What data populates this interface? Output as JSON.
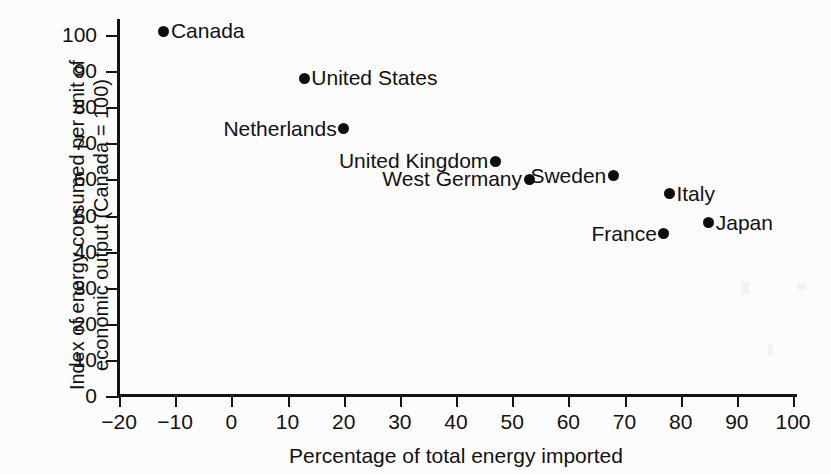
{
  "figure": {
    "top_caption_partial": "",
    "background_color": "#fcfcfc",
    "ink_color": "#111111"
  },
  "chart_data": {
    "type": "scatter",
    "title": "",
    "xlabel": "Percentage of total energy imported",
    "ylabel": "Index of energy consumed per unit of economic output (Canada = 100)",
    "xlim": [
      -20,
      100
    ],
    "ylim": [
      0,
      100
    ],
    "xticks": [
      -20,
      -10,
      0,
      10,
      20,
      30,
      40,
      50,
      60,
      70,
      80,
      90,
      100
    ],
    "xtick_labels": [
      "−20",
      "−10",
      "0",
      "10",
      "20",
      "30",
      "40",
      "50",
      "60",
      "70",
      "80",
      "90",
      "100"
    ],
    "yticks": [
      0,
      10,
      20,
      30,
      40,
      50,
      60,
      70,
      80,
      90,
      100
    ],
    "ytick_labels": [
      "0",
      "10",
      "20",
      "30",
      "40",
      "50",
      "60",
      "70",
      "80",
      "90",
      "100"
    ],
    "grid": false,
    "legend": "none",
    "marker": "filled-circle",
    "marker_color": "#0d0d0d",
    "points": [
      {
        "label": "Canada",
        "x": -12,
        "y": 101,
        "label_side": "right"
      },
      {
        "label": "United States",
        "x": 13,
        "y": 88,
        "label_side": "right"
      },
      {
        "label": "Netherlands",
        "x": 20,
        "y": 74,
        "label_side": "left"
      },
      {
        "label": "United Kingdom",
        "x": 47,
        "y": 65,
        "label_side": "left"
      },
      {
        "label": "West Germany",
        "x": 53,
        "y": 60,
        "label_side": "left"
      },
      {
        "label": "Sweden",
        "x": 68,
        "y": 61,
        "label_side": "left"
      },
      {
        "label": "Italy",
        "x": 78,
        "y": 56,
        "label_side": "right"
      },
      {
        "label": "France",
        "x": 77,
        "y": 45,
        "label_side": "left"
      },
      {
        "label": "Japan",
        "x": 85,
        "y": 48,
        "label_side": "right"
      }
    ]
  }
}
